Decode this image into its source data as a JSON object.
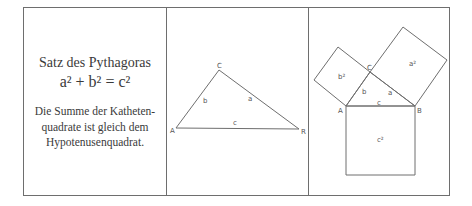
{
  "text_panel": {
    "title": "Satz des Pythagoras",
    "formula": "a² + b² = c²",
    "body_lines": [
      "Die Summe der Katheten-",
      "quadrate ist gleich dem",
      "Hypotenusenquadrat."
    ]
  },
  "triangle_panel": {
    "vertex_a": "A",
    "vertex_b": "R",
    "vertex_c": "C",
    "side_a": "a",
    "side_b": "b",
    "side_c": "c"
  },
  "squares_panel": {
    "vertex_a": "A",
    "vertex_b": "B",
    "vertex_c": "C",
    "side_a": "a",
    "side_b": "b",
    "side_c": "c",
    "square_a": "a²",
    "square_b": "b²",
    "square_c": "c²"
  },
  "colors": {
    "line": "#6e6e6e",
    "text": "#3a3a3a"
  }
}
